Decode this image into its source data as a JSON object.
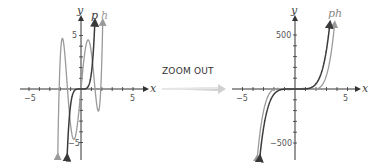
{
  "transition": {
    "label": "ZOOM OUT",
    "arrow_color": "#c8c8c8"
  },
  "colors": {
    "p": "#3a3a3a",
    "h": "#9a9a9a",
    "axis": "#333333"
  },
  "chart_data": [
    {
      "type": "line",
      "title": "",
      "xlabel": "x",
      "ylabel": "y",
      "xlim": [
        -6,
        6
      ],
      "ylim": [
        -6.5,
        6.5
      ],
      "x_ticks": [
        -5,
        5
      ],
      "y_ticks": [
        5,
        -5
      ],
      "x_tick_labels": [
        "−5",
        "5"
      ],
      "y_tick_labels": [
        "5",
        "−5"
      ],
      "grid": false,
      "series": [
        {
          "name": "p",
          "formula": "1.5*x^5",
          "color": "#3a3a3a"
        },
        {
          "name": "h",
          "formula": "1.5*(x+2.1)(x+1.3)x(x-1.35)(x-1.9)",
          "color": "#9a9a9a"
        }
      ],
      "legend": [
        "p",
        "h"
      ]
    },
    {
      "type": "line",
      "title": "",
      "xlabel": "x",
      "ylabel": "y",
      "xlim": [
        -6,
        6
      ],
      "ylim": [
        -650,
        650
      ],
      "x_ticks": [
        -5,
        5
      ],
      "y_ticks": [
        500,
        -500
      ],
      "x_tick_labels": [
        "−5",
        "5"
      ],
      "y_tick_labels": [
        "500",
        "−500"
      ],
      "grid": false,
      "series": [
        {
          "name": "p",
          "formula": "1.5*x^5",
          "color": "#3a3a3a"
        },
        {
          "name": "h",
          "formula": "1.5*(x+2.1)(x+1.3)x(x-1.35)(x-1.9)",
          "color": "#9a9a9a"
        }
      ],
      "legend": [
        "ph"
      ]
    }
  ],
  "left": {
    "x_label": "x",
    "y_label": "y",
    "p_label": "p",
    "h_label": "h",
    "xmin_label": "−5",
    "xmax_label": "5",
    "ymax_label": "5",
    "ymin_label": "−5"
  },
  "right": {
    "x_label": "x",
    "y_label": "y",
    "ph_label": "ph",
    "xmin_label": "−5",
    "xmax_label": "5",
    "ymax_label": "500",
    "ymin_label": "−500"
  }
}
